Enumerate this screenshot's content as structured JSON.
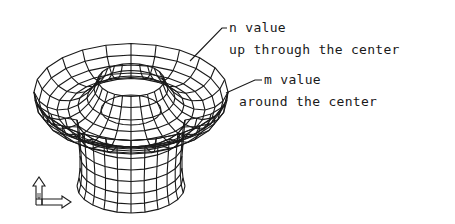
{
  "diagram": {
    "type": "revolved-surface-wireframe",
    "annotations": [
      {
        "id": "n",
        "title": "n value",
        "subtitle": "up through the center"
      },
      {
        "id": "m",
        "title": "m value",
        "subtitle": "around the center"
      }
    ],
    "ucs_icon": {
      "label": "W"
    },
    "colors": {
      "line": "#1a1a1a",
      "background": "#ffffff"
    }
  }
}
